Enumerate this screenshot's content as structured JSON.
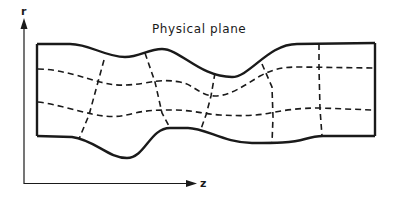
{
  "figure": {
    "title": "Physical plane",
    "axes": {
      "vertical_label": "r",
      "horizontal_label": "z"
    },
    "colors": {
      "ink": "#1a1a1a",
      "background": "#ffffff"
    }
  }
}
